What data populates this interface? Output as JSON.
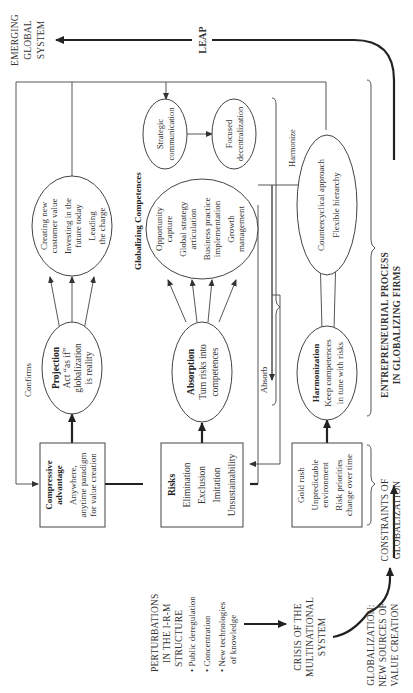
{
  "diagram": {
    "orientation": "rotated-90-ccw",
    "title_axis": "Entrepreneurial process in globalizing firms",
    "outer_labels": {
      "emerging": [
        "EMERGING",
        "GLOBAL",
        "SYSTEM"
      ],
      "leap": "LEAP",
      "entrepreneurial": [
        "ENTREPRENEURIAL PROCESS",
        "IN GLOBALIZING FIRMS"
      ],
      "constraints": [
        "CONSTRAINTS OF",
        "GLOBALIZATION"
      ],
      "globalization": [
        "GLOBALIZATION:",
        "NEW SOURCES OF",
        "VALUE CREATION"
      ],
      "crisis": [
        "CRISIS OF THE",
        "MULTINATIONAL",
        "SYSTEM"
      ],
      "perturbations": {
        "title": [
          "PERTURBATIONS",
          "IN THE I-R-M",
          "STRUCTURE"
        ],
        "bullets": [
          [
            "Public deregulation"
          ],
          [
            "Concentration"
          ],
          [
            "New technologies",
            "of knowledge"
          ]
        ]
      }
    },
    "boxes": {
      "compressive": {
        "title": [
          "Compressive",
          "advantage"
        ],
        "body": [
          "Anywhere,",
          "anytime paradigm",
          "for value creation"
        ]
      },
      "risks": {
        "title": [
          "Risks"
        ],
        "body": [
          "Elimination",
          "Exclusion",
          "Imitation",
          "Unsustainability"
        ]
      },
      "gold": {
        "title": [],
        "body": [
          "Gold rush",
          "Unpredictable",
          "environment",
          "Risk priorities",
          "change over time"
        ]
      }
    },
    "ellipses": {
      "projection": {
        "title": "Projection",
        "body": [
          "Act “as if”",
          "globalization",
          "is reality"
        ]
      },
      "absorption": {
        "title": "Absorption",
        "body": [
          "Turn risks into",
          "competences"
        ]
      },
      "harmonization": {
        "title": "Harmonization",
        "body": [
          "Keep competences",
          "in tune with risks"
        ]
      },
      "creating": {
        "body": [
          "Creating new",
          "customer value",
          "Investing in the",
          "future today",
          "Leading",
          "the charge"
        ]
      },
      "opportunity": {
        "body": [
          "Opportunity",
          "capture",
          "Global strategy",
          "articulation",
          "Business practice",
          "implementation",
          "Growth",
          "management"
        ]
      },
      "countercyclical": {
        "body": [
          "Countercyclical approach",
          "Flexible hierarchy"
        ]
      },
      "strategic": {
        "body": [
          "Strategic",
          "communication"
        ]
      },
      "focused": {
        "body": [
          "Focused",
          "decentralization"
        ]
      }
    },
    "edge_labels": {
      "confirms": "Confirms",
      "absorb": "Absorb",
      "harmonize": "Harmonize",
      "globalizing_competences": "Globalizing Competences"
    }
  }
}
